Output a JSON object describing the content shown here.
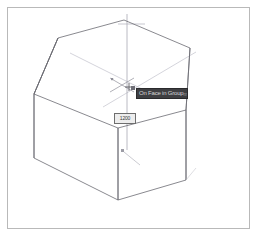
{
  "app": {
    "title": "3D Modeling Viewport",
    "background_color": "#ffffff",
    "frame_color": "#b9b9b9"
  },
  "viewport": {
    "name": "perspective-view",
    "edge_color": "#6b6b72",
    "inference_color": "#b9b9c4",
    "axis_color": "#9a9aa4"
  },
  "tooltip": {
    "text": "On Face in Group",
    "unit": "mm",
    "background_color": "#3f3f42",
    "text_color": "#d6d6d6"
  },
  "dimension_field": {
    "value": "1200",
    "background_color": "#ededed",
    "border_color": "#6e6e6e"
  },
  "cursor": {
    "name": "move-tool-cursor",
    "x": 131,
    "y": 85
  },
  "geometry": {
    "description": "Hexagonal prism wireframe",
    "top_face": [
      [
        58,
        38
      ],
      [
        124,
        20
      ],
      [
        190,
        48
      ],
      [
        186,
        110
      ],
      [
        118,
        128
      ],
      [
        34,
        94
      ]
    ],
    "bottom_face": [
      [
        34,
        94
      ],
      [
        118,
        128
      ],
      [
        186,
        110
      ],
      [
        186,
        180
      ],
      [
        118,
        200
      ],
      [
        34,
        158
      ]
    ],
    "vertical_edges": [
      [
        [
          34,
          94
        ],
        [
          34,
          158
        ]
      ],
      [
        [
          118,
          128
        ],
        [
          118,
          200
        ]
      ],
      [
        [
          186,
          110
        ],
        [
          186,
          180
        ]
      ]
    ]
  }
}
